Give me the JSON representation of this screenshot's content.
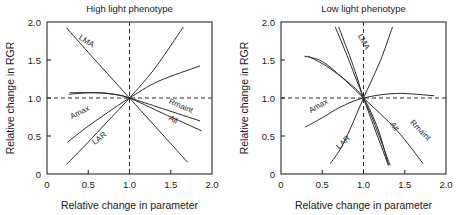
{
  "figure": {
    "width": 468,
    "height": 215,
    "background": "#ffffff",
    "line_color": "#2b2b2b"
  },
  "chart_data": [
    {
      "type": "line",
      "panel_id": "high-light",
      "title": "High light phenotype",
      "xlabel": "Relative change in parameter",
      "ylabel": "Relative change in RGR",
      "xlim": [
        0,
        2.0
      ],
      "ylim": [
        0,
        2.0
      ],
      "xticks": [
        0,
        0.5,
        1.0,
        1.5,
        2.0
      ],
      "xticklabels": [
        "0",
        "0.5",
        "1.0",
        "1.5",
        "2.0"
      ],
      "yticks": [
        0,
        0.5,
        1.0,
        1.5,
        2.0
      ],
      "yticklabels": [
        "0",
        "0.5",
        "1.0",
        "1.5",
        "2.0"
      ],
      "grid": false,
      "legend": "inline-curve-labels",
      "reference_lines": [
        {
          "name": "vertical-unity",
          "orientation": "vertical",
          "value": 1.0,
          "style": "dashed"
        },
        {
          "name": "horizontal-unity",
          "orientation": "horizontal",
          "value": 1.0,
          "style": "dashed"
        }
      ],
      "convergence_point": [
        1.0,
        1.0
      ],
      "series": [
        {
          "name": "LMA",
          "label": "LMA",
          "label_pos": [
            0.38,
            1.78
          ],
          "label_rotation": 33,
          "points": [
            [
              0.24,
              1.92
            ],
            [
              0.5,
              1.6
            ],
            [
              0.75,
              1.3
            ],
            [
              1.0,
              1.0
            ],
            [
              1.3,
              0.64
            ],
            [
              1.7,
              0.16
            ]
          ]
        },
        {
          "name": "Amax",
          "label": "Amax",
          "label_pos": [
            0.3,
            0.72
          ],
          "label_rotation": -27,
          "points": [
            [
              0.25,
              0.42
            ],
            [
              0.5,
              0.63
            ],
            [
              0.75,
              0.82
            ],
            [
              1.0,
              1.0
            ],
            [
              1.35,
              1.22
            ],
            [
              1.85,
              1.42
            ]
          ]
        },
        {
          "name": "LAR",
          "label": "LAR",
          "label_pos": [
            0.58,
            0.38
          ],
          "label_rotation": -38,
          "points": [
            [
              0.24,
              0.13
            ],
            [
              0.5,
              0.42
            ],
            [
              0.75,
              0.71
            ],
            [
              1.0,
              1.0
            ],
            [
              1.3,
              1.38
            ],
            [
              1.65,
              1.93
            ]
          ]
        },
        {
          "name": "Rmaint",
          "label": "Rmaint",
          "label_pos": [
            1.47,
            0.93
          ],
          "label_rotation": 23,
          "points": [
            [
              0.28,
              1.07
            ],
            [
              0.5,
              1.07
            ],
            [
              0.75,
              1.06
            ],
            [
              1.0,
              1.0
            ],
            [
              1.4,
              0.86
            ],
            [
              1.85,
              0.7
            ]
          ]
        },
        {
          "name": "All",
          "label": "All",
          "label_pos": [
            1.47,
            0.72
          ],
          "label_rotation": 32,
          "points": [
            [
              0.27,
              1.05
            ],
            [
              0.55,
              1.07
            ],
            [
              0.8,
              1.05
            ],
            [
              1.0,
              1.0
            ],
            [
              1.4,
              0.8
            ],
            [
              1.87,
              0.57
            ]
          ]
        }
      ]
    },
    {
      "type": "line",
      "panel_id": "low-light",
      "title": "Low light phenotype",
      "xlabel": "Relative change in parameter",
      "ylabel": "Relative change in RGR",
      "xlim": [
        0,
        2.0
      ],
      "ylim": [
        0,
        2.0
      ],
      "xticks": [
        0,
        0.5,
        1.0,
        1.5,
        2.0
      ],
      "xticklabels": [
        "0",
        "0.5",
        "1.0",
        "1.5",
        "2.0"
      ],
      "yticks": [
        0,
        0.5,
        1.0,
        1.5,
        2.0
      ],
      "yticklabels": [
        "0",
        "0.5",
        "1.0",
        "1.5",
        "2.0"
      ],
      "grid": false,
      "legend": "inline-curve-labels",
      "reference_lines": [
        {
          "name": "vertical-unity",
          "orientation": "vertical",
          "value": 1.0,
          "style": "dashed"
        },
        {
          "name": "horizontal-unity",
          "orientation": "horizontal",
          "value": 1.0,
          "style": "dashed"
        }
      ],
      "convergence_point": [
        1.0,
        1.0
      ],
      "series": [
        {
          "name": "LMA",
          "label": "LMA",
          "label_pos": [
            0.93,
            1.82
          ],
          "label_rotation": 62,
          "points": [
            [
              0.66,
              1.93
            ],
            [
              0.8,
              1.56
            ],
            [
              0.9,
              1.28
            ],
            [
              1.0,
              1.0
            ],
            [
              1.1,
              0.7
            ],
            [
              1.3,
              0.12
            ]
          ]
        },
        {
          "name": "LMA-2",
          "label": "",
          "label_pos": [
            0,
            0
          ],
          "label_rotation": 0,
          "points": [
            [
              0.7,
              1.93
            ],
            [
              0.83,
              1.56
            ],
            [
              0.92,
              1.28
            ],
            [
              1.0,
              1.0
            ],
            [
              1.12,
              0.7
            ],
            [
              1.32,
              0.12
            ]
          ]
        },
        {
          "name": "Amax",
          "label": "Amax",
          "label_pos": [
            0.36,
            0.8
          ],
          "label_rotation": -30,
          "points": [
            [
              0.3,
              0.62
            ],
            [
              0.5,
              0.74
            ],
            [
              0.72,
              0.88
            ],
            [
              1.0,
              1.0
            ],
            [
              1.4,
              1.06
            ],
            [
              1.85,
              1.03
            ]
          ]
        },
        {
          "name": "LAR",
          "label": "LAR",
          "label_pos": [
            0.71,
            0.32
          ],
          "label_rotation": -45,
          "points": [
            [
              0.6,
              0.14
            ],
            [
              0.72,
              0.33
            ],
            [
              0.85,
              0.62
            ],
            [
              1.0,
              1.0
            ],
            [
              1.2,
              1.48
            ],
            [
              1.35,
              1.93
            ]
          ]
        },
        {
          "name": "Rmaint",
          "label": "Rmaint",
          "label_pos": [
            1.56,
            0.67
          ],
          "label_rotation": 45,
          "points": [
            [
              0.29,
              1.55
            ],
            [
              0.5,
              1.48
            ],
            [
              0.75,
              1.26
            ],
            [
              1.0,
              1.0
            ],
            [
              1.4,
              0.58
            ],
            [
              1.72,
              0.14
            ]
          ]
        },
        {
          "name": "All",
          "label": "All",
          "label_pos": [
            1.32,
            0.66
          ],
          "label_rotation": 62,
          "points": [
            [
              0.33,
              1.55
            ],
            [
              0.55,
              1.42
            ],
            [
              0.8,
              1.22
            ],
            [
              1.0,
              1.0
            ],
            [
              1.18,
              0.58
            ],
            [
              1.3,
              0.12
            ]
          ]
        }
      ]
    }
  ]
}
